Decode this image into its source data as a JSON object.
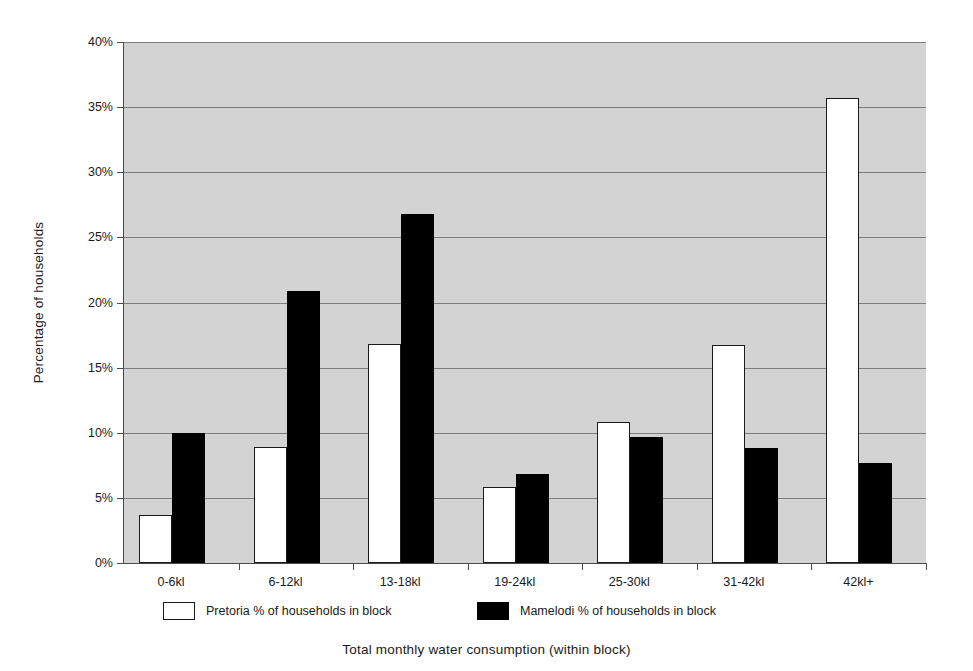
{
  "chart_data": {
    "type": "bar",
    "title": "",
    "xlabel": "Total monthly water consumption (within block)",
    "ylabel": "Percentage of households",
    "categories": [
      "0-6kl",
      "6-12kl",
      "13-18kl",
      "19-24kl",
      "25-30kl",
      "31-42kl",
      "42kl+"
    ],
    "series": [
      {
        "name": "Pretoria % of households in block",
        "color": "#ffffff",
        "values": [
          3.7,
          8.9,
          16.8,
          5.8,
          10.8,
          16.7,
          35.7
        ]
      },
      {
        "name": "Mamelodi % of households in block",
        "color": "#000000",
        "values": [
          10.0,
          20.9,
          26.8,
          6.8,
          9.7,
          8.8,
          7.7
        ]
      }
    ],
    "ylim": [
      0,
      40
    ],
    "ytick_values": [
      0,
      5,
      10,
      15,
      20,
      25,
      30,
      35,
      40
    ],
    "ytick_labels": [
      "0%",
      "5%",
      "10%",
      "15%",
      "20%",
      "25%",
      "30%",
      "35%",
      "40%"
    ],
    "grid": true,
    "legend_position": "bottom",
    "plot_background": "#d3d3d3",
    "gridline_color": "#7d7d7d",
    "axis_color": "#4a4a4a"
  },
  "legend": {
    "items": [
      {
        "label": "Pretoria % of households in block",
        "swatch": "white"
      },
      {
        "label": "Mamelodi % of households in block",
        "swatch": "black"
      }
    ]
  }
}
